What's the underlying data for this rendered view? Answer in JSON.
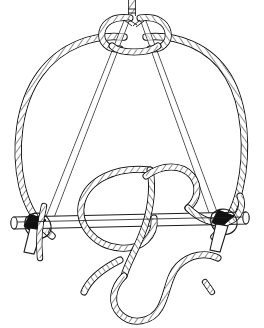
{
  "page": {
    "background_color": "#ffffff",
    "width": 264,
    "height": 328
  },
  "caption": {
    "text": "any resources.",
    "note": "partially cropped line of body text at top edge",
    "color": "#2b2b2b"
  },
  "figure": {
    "name": "tripod-lashing-knot-diagram",
    "title": "Rope lashing on crossed poles",
    "style": "black and white line engraving",
    "line_color": "#1a1a1a",
    "fill_color": "#ffffff",
    "knot_fill_color": "#111111",
    "elements": [
      {
        "name": "standing-rope-top",
        "label": "Vertical standing rope entering from top edge"
      },
      {
        "name": "collar-knot",
        "label": "Collar wrap knot binding the pole apex"
      },
      {
        "name": "left-pole",
        "label": "Left slanted pole shaft"
      },
      {
        "name": "right-pole",
        "label": "Right slanted pole shaft"
      },
      {
        "name": "left-rope-arc",
        "label": "Large left rope loop arc"
      },
      {
        "name": "right-rope-arc",
        "label": "Large right rope loop arc"
      },
      {
        "name": "crossbar",
        "label": "Horizontal crossbar stick with rounded ends"
      },
      {
        "name": "left-lashing",
        "label": "Dark lashing knot at left pole and crossbar junction"
      },
      {
        "name": "right-lashing",
        "label": "Dark lashing knot at right pole and crossbar junction"
      },
      {
        "name": "center-rope-tangle",
        "label": "Central looping rope passing over and under the crossbar"
      },
      {
        "name": "rope-free-end",
        "label": "Free working end of rope curving to bottom right"
      },
      {
        "name": "bottom-rope-bight",
        "label": "U shaped rope bight at bottom of figure"
      },
      {
        "name": "rope-fragment-right",
        "label": "Small rope fragment at right edge"
      }
    ]
  }
}
